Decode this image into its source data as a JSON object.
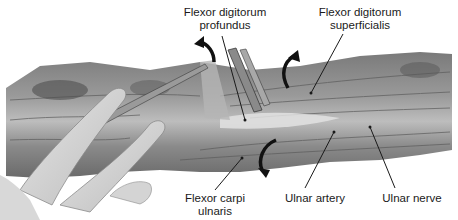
{
  "figure": {
    "colors": {
      "background": "#ffffff",
      "tissue_dark": "#5a5a5a",
      "tissue_mid": "#8c8c8c",
      "tissue_light": "#c8c8c8",
      "glove": "#d9d9d9",
      "label_text": "#1a1a1a",
      "leader_line": "#1a1a1a"
    },
    "labels": {
      "fdp": {
        "line1": "Flexor digitorum",
        "line2": "profundus"
      },
      "fds": {
        "line1": "Flexor digitorum",
        "line2": "superficialis"
      },
      "fcu": {
        "line1": "Flexor carpi",
        "line2": "ulnaris"
      },
      "ulnar_artery": {
        "line1": "Ulnar artery"
      },
      "ulnar_nerve": {
        "line1": "Ulnar nerve"
      }
    },
    "arrows": [
      {
        "name": "retract-fdp-arrow",
        "direction": "up-left"
      },
      {
        "name": "retract-fds-arrow",
        "direction": "up-right"
      },
      {
        "name": "retract-fcu-arrow",
        "direction": "down"
      }
    ]
  }
}
